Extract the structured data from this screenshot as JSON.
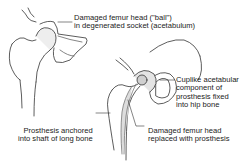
{
  "diagram": {
    "labels": {
      "damaged_head_line1": "Damaged femur head (\"ball\")",
      "damaged_head_line2": "in degenerated socket (acetabulum)",
      "cup_line1": "Cuplike acetabular",
      "cup_line2": "component of",
      "cup_line3": "prosthesis fixed",
      "cup_line4": "into hip bone",
      "stem_line1": "Prosthesis anchored",
      "stem_line2": "into shaft of long bone",
      "replaced_line1": "Damaged femur head",
      "replaced_line2": "replaced with prosthesis"
    },
    "colors": {
      "line": "#333333",
      "shade": "#cfcfcf",
      "text": "#222222"
    }
  }
}
